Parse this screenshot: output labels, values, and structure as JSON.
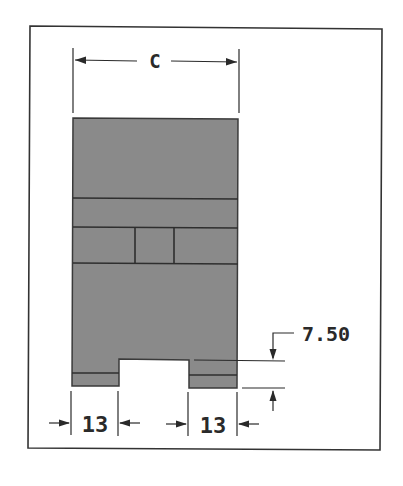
{
  "diagram": {
    "type": "technical-drawing",
    "colors": {
      "frame": "#333333",
      "body_fill": "#8a8a8a",
      "body_stroke": "#3a3a3a",
      "dimension_line": "#2a2a2a",
      "background": "#ffffff"
    },
    "dimensions": {
      "width_label": "C",
      "notch_height_label": "7.50",
      "left_foot_width_label": "13",
      "right_foot_width_label": "13"
    }
  }
}
